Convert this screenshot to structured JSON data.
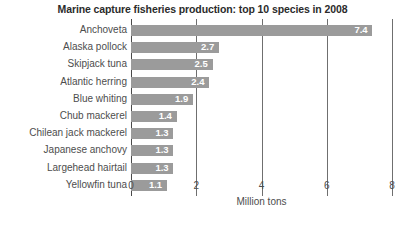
{
  "chart_data": {
    "type": "bar",
    "orientation": "horizontal",
    "title": "Marine capture fisheries production: top 10 species in 2008",
    "xlabel": "Million tons",
    "ylabel": "",
    "xlim": [
      0,
      8
    ],
    "xticks": [
      "0",
      "2",
      "4",
      "6",
      "8"
    ],
    "xtick_values": [
      0,
      2,
      4,
      6,
      8
    ],
    "grid": true,
    "legend": "none",
    "bar_color": "#9b9b9b",
    "value_label_color": "#ffffff",
    "categories": [
      "Anchoveta",
      "Alaska pollock",
      "Skipjack tuna",
      "Atlantic herring",
      "Blue whiting",
      "Chub mackerel",
      "Chilean jack mackerel",
      "Japanese anchovy",
      "Largehead hairtail",
      "Yellowfin tuna"
    ],
    "values": [
      7.4,
      2.7,
      2.5,
      2.4,
      1.9,
      1.4,
      1.3,
      1.3,
      1.3,
      1.1
    ],
    "value_labels": [
      "7.4",
      "2.7",
      "2.5",
      "2.4",
      "1.9",
      "1.4",
      "1.3",
      "1.3",
      "1.3",
      "1.1"
    ]
  }
}
